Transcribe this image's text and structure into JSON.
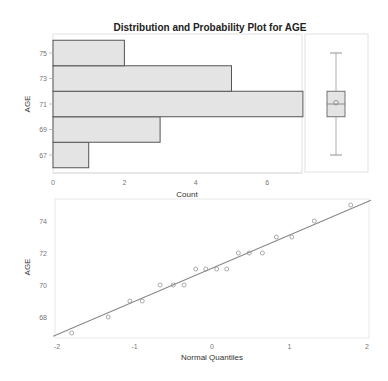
{
  "chart_data": [
    {
      "type": "bar",
      "orientation": "horizontal",
      "title": "Distribution and Probability Plot for AGE",
      "xlabel": "Count",
      "ylabel": "AGE",
      "bins": [
        {
          "lo": 66,
          "hi": 68,
          "center": 67,
          "count": 1
        },
        {
          "lo": 68,
          "hi": 70,
          "center": 69,
          "count": 3
        },
        {
          "lo": 70,
          "hi": 72,
          "center": 71,
          "count": 7
        },
        {
          "lo": 72,
          "hi": 74,
          "center": 73,
          "count": 5
        },
        {
          "lo": 74,
          "hi": 76,
          "center": 75,
          "count": 2
        }
      ],
      "categories": [
        "67",
        "69",
        "71",
        "73",
        "75"
      ],
      "values": [
        1,
        3,
        7,
        5,
        2
      ],
      "xticks": [
        "0",
        "2",
        "4",
        "6"
      ],
      "yticks": [
        "67",
        "69",
        "71",
        "73",
        "75"
      ],
      "xlim": [
        0,
        8.3
      ],
      "ylim": [
        66,
        76
      ],
      "grid": false
    },
    {
      "type": "box",
      "variable": "AGE",
      "min": 67,
      "q1": 70,
      "median": 71,
      "mean": 71.1,
      "q3": 72,
      "max": 75
    },
    {
      "type": "scatter",
      "title": "",
      "xlabel": "Normal Quantiles",
      "ylabel": "AGE",
      "x": [
        -1.81,
        -1.34,
        -1.06,
        -0.9,
        -0.67,
        -0.5,
        -0.36,
        -0.21,
        -0.08,
        0.06,
        0.19,
        0.34,
        0.48,
        0.65,
        0.83,
        1.03,
        1.32,
        1.79
      ],
      "y": [
        67,
        68,
        69,
        69,
        70,
        70,
        70,
        71,
        71,
        71,
        71,
        72,
        72,
        72,
        73,
        73,
        74,
        75
      ],
      "reference_line": {
        "x": [
          -2.05,
          2.05
        ],
        "y": [
          66.8,
          75.3
        ]
      },
      "xticks": [
        "-2",
        "-1",
        "0",
        "1",
        "2"
      ],
      "yticks": [
        "68",
        "70",
        "72",
        "74"
      ],
      "xlim": [
        -2.05,
        2.05
      ],
      "ylim": [
        66.8,
        75.3
      ],
      "grid": false
    }
  ],
  "figure": {
    "title": "Distribution and Probability Plot for AGE",
    "hist_xlabel": "Count",
    "hist_ylabel": "AGE",
    "qq_xlabel": "Normal Quantiles",
    "qq_ylabel": "AGE"
  },
  "colors": {
    "bar_fill": "#e4e4e4",
    "bar_stroke": "#555555",
    "frame": "#dddddd",
    "line": "#888888",
    "marker": "#888888"
  }
}
